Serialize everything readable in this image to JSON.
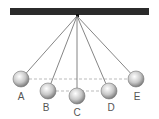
{
  "diagram": {
    "type": "pendulum",
    "bar_color": "#2b2b2b",
    "string_color": "#666666",
    "dash_color": "#bbbbbb",
    "positions": [
      {
        "label": "A",
        "x": 21,
        "y": 79,
        "lx": 21,
        "ly": 100
      },
      {
        "label": "B",
        "x": 48,
        "y": 91,
        "lx": 46,
        "ly": 111
      },
      {
        "label": "C",
        "x": 77,
        "y": 96,
        "lx": 77,
        "ly": 116
      },
      {
        "label": "D",
        "x": 109,
        "y": 91,
        "lx": 111,
        "ly": 111
      },
      {
        "label": "E",
        "x": 136,
        "y": 79,
        "lx": 137,
        "ly": 100
      }
    ]
  }
}
